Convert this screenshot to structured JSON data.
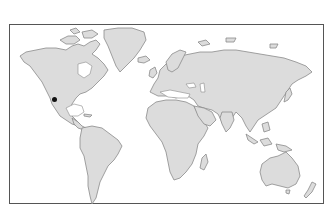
{
  "map": {
    "type": "world-outline",
    "colors": {
      "land": "#dcdcdc",
      "coastline": "#8a8a8a",
      "ocean": "#ffffff",
      "frame": "#555555",
      "marker": "#111111"
    },
    "markers": [
      {
        "name": "location-marker",
        "region": "southwestern North America",
        "x": 54,
        "y": 99
      }
    ]
  }
}
